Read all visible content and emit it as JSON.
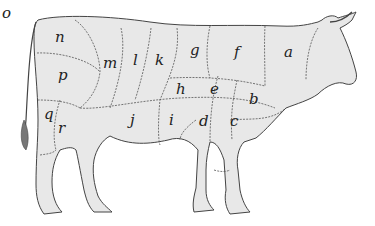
{
  "diagram": {
    "type": "beef cuts diagram",
    "fill_color": "#e8e8e8",
    "line_color": "#444444",
    "labels": [
      {
        "id": "o",
        "text": "o",
        "x": 22,
        "y": 23
      },
      {
        "id": "n",
        "text": "n",
        "x": 58,
        "y": 42
      },
      {
        "id": "p",
        "text": "p",
        "x": 62,
        "y": 80
      },
      {
        "id": "m",
        "text": "m",
        "x": 105,
        "y": 67
      },
      {
        "id": "l",
        "text": "l",
        "x": 133,
        "y": 64
      },
      {
        "id": "k",
        "text": "k",
        "x": 157,
        "y": 64
      },
      {
        "id": "g",
        "text": "g",
        "x": 193,
        "y": 54
      },
      {
        "id": "f",
        "text": "f",
        "x": 236,
        "y": 56
      },
      {
        "id": "a",
        "text": "a",
        "x": 287,
        "y": 56
      },
      {
        "id": "h",
        "text": "h",
        "x": 177,
        "y": 92
      },
      {
        "id": "e",
        "text": "e",
        "x": 212,
        "y": 92
      },
      {
        "id": "b",
        "text": "b",
        "x": 251,
        "y": 102
      },
      {
        "id": "q",
        "text": "q",
        "x": 48,
        "y": 117
      },
      {
        "id": "r",
        "text": "r",
        "x": 61,
        "y": 131
      },
      {
        "id": "j",
        "text": "j",
        "x": 132,
        "y": 123
      },
      {
        "id": "i",
        "text": "i",
        "x": 171,
        "y": 123
      },
      {
        "id": "d",
        "text": "d",
        "x": 203,
        "y": 124
      },
      {
        "id": "c",
        "text": "c",
        "x": 233,
        "y": 124
      }
    ]
  }
}
